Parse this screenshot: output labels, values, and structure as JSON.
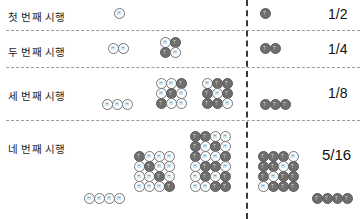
{
  "figure": {
    "title": "",
    "coin_faces": {
      "H": "H",
      "T": "T"
    },
    "colors": {
      "heads_fill": "#fdfdfd",
      "tails_fill": "#6e6e6e",
      "separator": "#9a9a9a",
      "divider": "#3a3a3a",
      "text": "#1a1a1a"
    }
  },
  "rows": [
    {
      "label": "첫 번째 시행",
      "fraction": "1/2",
      "left_groups": [
        {
          "grid": [
            [
              "H"
            ]
          ]
        }
      ],
      "right_groups": [
        {
          "grid": [
            [
              "T"
            ]
          ]
        }
      ]
    },
    {
      "label": "두 번째 시행",
      "fraction": "1/4",
      "left_groups": [
        {
          "grid": [
            [
              "H",
              "H"
            ]
          ]
        },
        {
          "grid": [
            [
              "H",
              "T"
            ],
            [
              "T",
              "H"
            ]
          ]
        }
      ],
      "right_groups": [
        {
          "grid": [
            [
              "T",
              "T"
            ]
          ]
        }
      ]
    },
    {
      "label": "세 번째 시행",
      "fraction": "1/8",
      "left_groups": [
        {
          "grid": [
            [
              "H",
              "H",
              "H"
            ]
          ]
        },
        {
          "grid": [
            [
              "H",
              "H",
              "T"
            ],
            [
              "H",
              "T",
              "H"
            ],
            [
              "T",
              "H",
              "H"
            ]
          ]
        },
        {
          "grid": [
            [
              "H",
              "T",
              "T"
            ],
            [
              "T",
              "H",
              "T"
            ],
            [
              "T",
              "T",
              "H"
            ]
          ]
        }
      ],
      "right_groups": [
        {
          "grid": [
            [
              "T",
              "T",
              "T"
            ]
          ]
        }
      ]
    },
    {
      "label": "네 번째 시행",
      "fraction": "5/16",
      "left_groups": [
        {
          "grid": [
            [
              "H",
              "H",
              "H",
              "H"
            ]
          ]
        },
        {
          "grid": [
            [
              "T",
              "H",
              "H",
              "H"
            ],
            [
              "H",
              "T",
              "H",
              "H"
            ],
            [
              "H",
              "H",
              "T",
              "H"
            ],
            [
              "H",
              "H",
              "H",
              "T"
            ]
          ]
        },
        {
          "grid": [
            [
              "T",
              "T",
              "H",
              "H"
            ],
            [
              "T",
              "H",
              "T",
              "H"
            ],
            [
              "T",
              "H",
              "H",
              "T"
            ],
            [
              "H",
              "T",
              "T",
              "H"
            ],
            [
              "H",
              "T",
              "H",
              "T"
            ],
            [
              "H",
              "H",
              "T",
              "T"
            ]
          ]
        }
      ],
      "right_groups": [
        {
          "grid": [
            [
              "T",
              "T",
              "T",
              "H"
            ],
            [
              "T",
              "T",
              "H",
              "T"
            ],
            [
              "T",
              "H",
              "T",
              "T"
            ],
            [
              "H",
              "T",
              "T",
              "T"
            ]
          ]
        },
        {
          "grid": [
            [
              "T",
              "T",
              "T",
              "T"
            ]
          ]
        }
      ]
    }
  ],
  "layout": {
    "separators_y": [
      30,
      67,
      120
    ],
    "divider_x": 246
  }
}
